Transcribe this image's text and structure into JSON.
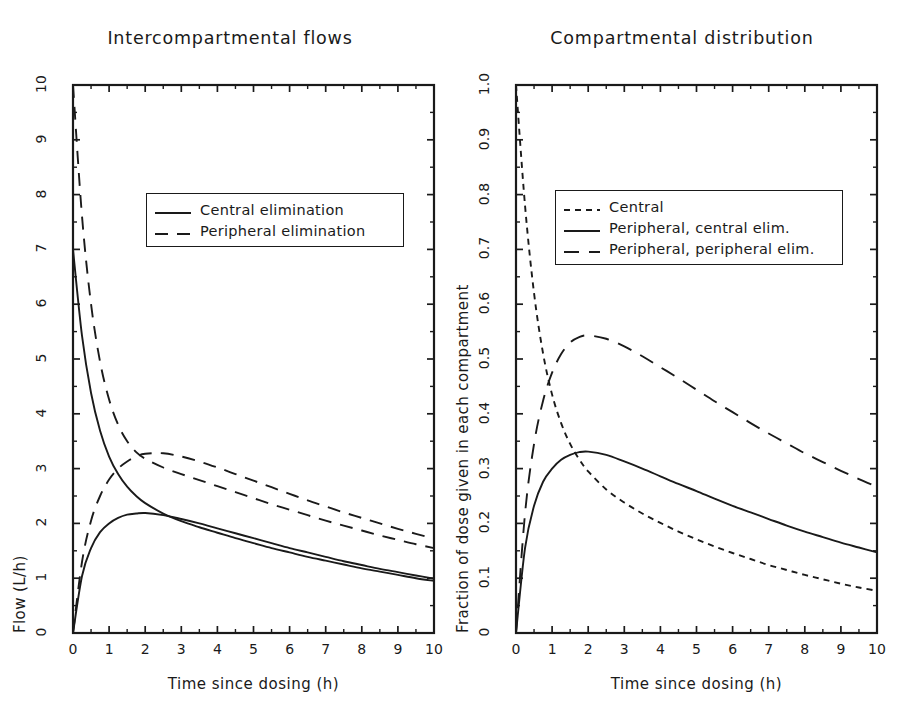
{
  "figure": {
    "background": "#ffffff",
    "line_color": "#1a1a1a"
  },
  "panels": [
    {
      "id": "intercompartmental-flows",
      "title": "Intercompartmental flows",
      "xlabel": "Time since dosing (h)",
      "ylabel": "Flow (L/h)",
      "xticks": [
        "0",
        "1",
        "2",
        "3",
        "4",
        "5",
        "6",
        "7",
        "8",
        "9",
        "10"
      ],
      "yticks": [
        "0",
        "1",
        "2",
        "3",
        "4",
        "5",
        "6",
        "7",
        "8",
        "9",
        "10"
      ],
      "legend": [
        {
          "label": "Central elimination",
          "style": "solid"
        },
        {
          "label": "Peripheral elimination",
          "style": "dashed"
        }
      ]
    },
    {
      "id": "compartmental-distribution",
      "title": "Compartmental distribution",
      "xlabel": "Time since dosing (h)",
      "ylabel": "Fraction of dose given in each compartment",
      "xticks": [
        "0",
        "1",
        "2",
        "3",
        "4",
        "5",
        "6",
        "7",
        "8",
        "9",
        "10"
      ],
      "yticks": [
        "0",
        "0.1",
        "0.2",
        "0.3",
        "0.4",
        "0.5",
        "0.6",
        "0.7",
        "0.8",
        "0.9",
        "1.0"
      ],
      "legend": [
        {
          "label": "Central",
          "style": "shortdash"
        },
        {
          "label": "Peripheral, central elim.",
          "style": "solid"
        },
        {
          "label": "Peripheral, peripheral elim.",
          "style": "longdash"
        }
      ]
    }
  ],
  "chart_data": [
    {
      "type": "line",
      "title": "Intercompartmental flows",
      "xlabel": "Time since dosing (h)",
      "ylabel": "Flow (L/h)",
      "xlim": [
        0,
        10
      ],
      "ylim": [
        0,
        10
      ],
      "xticks": [
        0,
        1,
        2,
        3,
        4,
        5,
        6,
        7,
        8,
        9,
        10
      ],
      "yticks": [
        0,
        1,
        2,
        3,
        4,
        5,
        6,
        7,
        8,
        9,
        10
      ],
      "grid": false,
      "legend_position": "upper-center",
      "x": [
        0,
        0.25,
        0.5,
        0.75,
        1,
        1.25,
        1.5,
        1.75,
        2,
        2.5,
        3,
        3.5,
        4,
        4.5,
        5,
        5.5,
        6,
        6.5,
        7,
        7.5,
        8,
        8.5,
        9,
        9.5,
        10
      ],
      "series": [
        {
          "name": "Central to peripheral, central elimination",
          "style": "solid",
          "values": [
            7.0,
            5.42,
            4.38,
            3.69,
            3.22,
            2.9,
            2.67,
            2.5,
            2.37,
            2.18,
            2.04,
            1.93,
            1.83,
            1.73,
            1.64,
            1.55,
            1.47,
            1.39,
            1.32,
            1.25,
            1.18,
            1.12,
            1.06,
            1.0,
            0.95
          ]
        },
        {
          "name": "Peripheral to central, central elimination",
          "style": "solid",
          "values": [
            0.0,
            1.04,
            1.55,
            1.84,
            2.0,
            2.1,
            2.16,
            2.18,
            2.19,
            2.15,
            2.08,
            2.0,
            1.91,
            1.82,
            1.73,
            1.64,
            1.55,
            1.47,
            1.39,
            1.31,
            1.24,
            1.17,
            1.11,
            1.05,
            0.99
          ]
        },
        {
          "name": "Central to peripheral, peripheral elimination",
          "style": "dashed",
          "values": [
            10.0,
            7.6,
            6.0,
            4.95,
            4.26,
            3.8,
            3.5,
            3.3,
            3.18,
            3.02,
            2.9,
            2.79,
            2.68,
            2.57,
            2.46,
            2.35,
            2.25,
            2.15,
            2.05,
            1.96,
            1.87,
            1.78,
            1.7,
            1.62,
            1.55
          ]
        },
        {
          "name": "Peripheral to central, peripheral elimination",
          "style": "dashed",
          "values": [
            0.0,
            1.3,
            2.05,
            2.5,
            2.8,
            3.0,
            3.13,
            3.22,
            3.27,
            3.28,
            3.22,
            3.13,
            3.02,
            2.9,
            2.78,
            2.66,
            2.54,
            2.42,
            2.31,
            2.2,
            2.1,
            2.0,
            1.9,
            1.81,
            1.72
          ]
        }
      ]
    },
    {
      "type": "line",
      "title": "Compartmental distribution",
      "xlabel": "Time since dosing (h)",
      "ylabel": "Fraction of dose given in each compartment",
      "xlim": [
        0,
        10
      ],
      "ylim": [
        0,
        1.0
      ],
      "xticks": [
        0,
        1,
        2,
        3,
        4,
        5,
        6,
        7,
        8,
        9,
        10
      ],
      "yticks": [
        0.0,
        0.1,
        0.2,
        0.3,
        0.4,
        0.5,
        0.6,
        0.7,
        0.8,
        0.9,
        1.0
      ],
      "grid": false,
      "legend_position": "upper-center",
      "x": [
        0,
        0.25,
        0.5,
        0.75,
        1,
        1.25,
        1.5,
        1.75,
        2,
        2.5,
        3,
        3.5,
        4,
        4.5,
        5,
        5.5,
        6,
        6.5,
        7,
        7.5,
        8,
        8.5,
        9,
        9.5,
        10
      ],
      "series": [
        {
          "name": "Central",
          "style": "shortdash",
          "values": [
            1.0,
            0.78,
            0.62,
            0.51,
            0.435,
            0.383,
            0.345,
            0.317,
            0.295,
            0.262,
            0.238,
            0.218,
            0.201,
            0.185,
            0.171,
            0.158,
            0.146,
            0.135,
            0.124,
            0.115,
            0.106,
            0.098,
            0.09,
            0.083,
            0.077
          ]
        },
        {
          "name": "Peripheral, central elim.",
          "style": "solid",
          "values": [
            0.0,
            0.155,
            0.232,
            0.276,
            0.3,
            0.316,
            0.325,
            0.33,
            0.331,
            0.325,
            0.313,
            0.3,
            0.286,
            0.272,
            0.259,
            0.245,
            0.232,
            0.22,
            0.208,
            0.196,
            0.185,
            0.175,
            0.165,
            0.156,
            0.147
          ]
        },
        {
          "name": "Peripheral, peripheral elim.",
          "style": "longdash",
          "values": [
            0.0,
            0.218,
            0.345,
            0.424,
            0.475,
            0.509,
            0.53,
            0.54,
            0.543,
            0.537,
            0.523,
            0.505,
            0.485,
            0.465,
            0.444,
            0.423,
            0.403,
            0.383,
            0.364,
            0.346,
            0.328,
            0.312,
            0.296,
            0.281,
            0.267
          ]
        }
      ]
    }
  ]
}
